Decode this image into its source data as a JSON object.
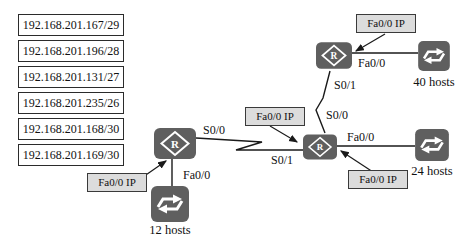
{
  "subnets": [
    "192.168.201.167/29",
    "192.168.201.196/28",
    "192.168.201.131/27",
    "192.168.201.235/26",
    "192.168.201.168/30",
    "192.168.201.169/30"
  ],
  "devices": {
    "router_letter": "R"
  },
  "hosts": {
    "left": "12 hosts",
    "top": "40 hosts",
    "right": "24 hosts"
  },
  "interfaces": {
    "left_fa": "Fa0/0",
    "lc_s00": "S0/0",
    "lc_s01": "S0/1",
    "ct_s01": "S0/1",
    "ct_s00": "S0/0",
    "top_fa": "Fa0/0",
    "right_fa": "Fa0/0"
  },
  "annotations": [
    "Fa0/0 IP",
    "Fa0/0 IP",
    "Fa0/0 IP",
    "Fa0/0 IP"
  ],
  "colors": {
    "device_fill": "#5f5f5f",
    "annotation_bg": "#dcdcdc",
    "wire": "#1a1a1a",
    "glyph": "#ffffff"
  }
}
